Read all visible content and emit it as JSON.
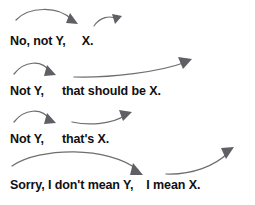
{
  "diagram": {
    "text_color": "#101012",
    "arrow_color": "#6e6e72",
    "background": "#ffffff",
    "rows": [
      {
        "id": "row-1",
        "reparandum": "No, not Y,",
        "repair": "X.",
        "arrow_1_name": "arc-arrow-down-right",
        "arrow_2_name": "arc-arrow-up-right-small"
      },
      {
        "id": "row-2",
        "reparandum": "Not Y,",
        "repair": "that should be X.",
        "arrow_1_name": "arc-arrow-down-right",
        "arrow_2_name": "arc-arrow-up-right-long"
      },
      {
        "id": "row-3",
        "reparandum": "Not Y,",
        "repair": "that's X.",
        "arrow_1_name": "arc-arrow-down-right",
        "arrow_2_name": "arc-arrow-up-right-medium"
      },
      {
        "id": "row-4",
        "reparandum": "Sorry, I don't mean Y,",
        "repair": "I mean X.",
        "arrow_1_name": "arc-arrow-down-right-long",
        "arrow_2_name": "arc-arrow-up-right-steep"
      }
    ]
  }
}
